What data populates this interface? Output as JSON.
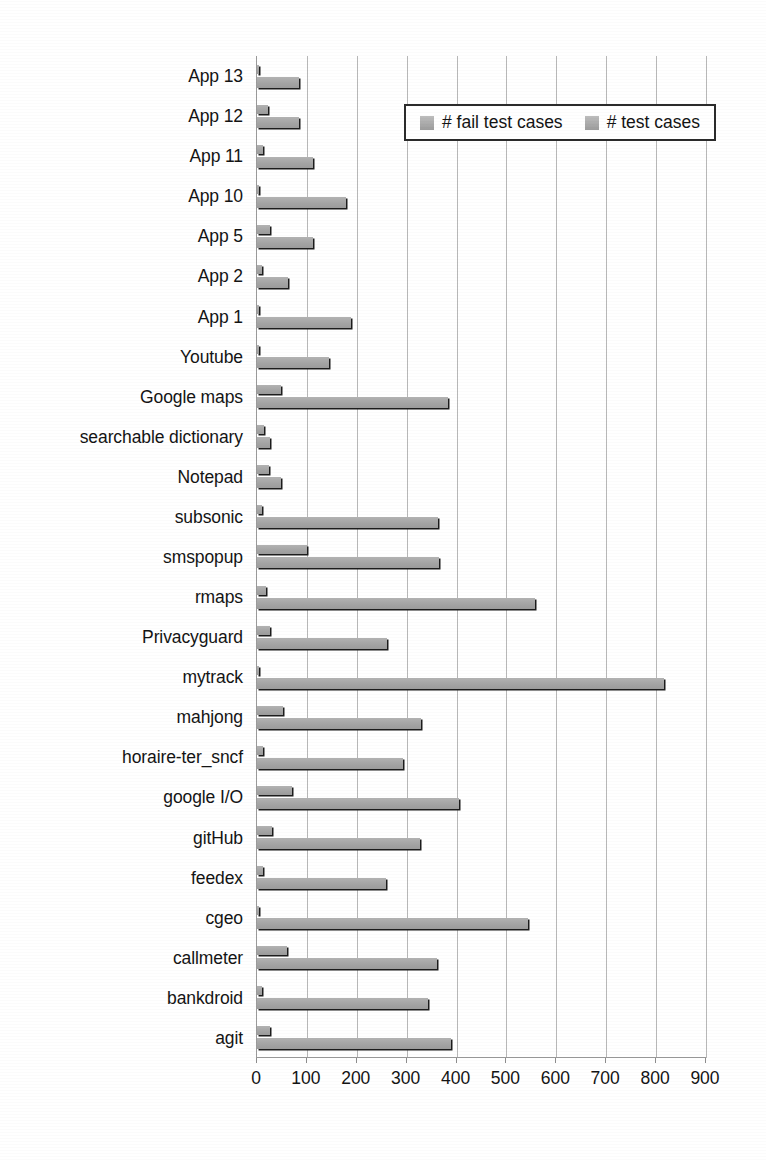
{
  "chart_data": {
    "type": "bar",
    "orientation": "horizontal",
    "title": "",
    "subtitle": "",
    "xlabel": "",
    "ylabel": "",
    "xlim": [
      0,
      900
    ],
    "xticks": [
      0,
      100,
      200,
      300,
      400,
      500,
      600,
      700,
      800,
      900
    ],
    "xtick_labels": [
      "0",
      "100",
      "200",
      "300",
      "400",
      "500",
      "600",
      "700",
      "800",
      "900"
    ],
    "grid": true,
    "grid_axis": "x",
    "legend_position": "top-right",
    "legend": [
      "# fail test cases",
      "# test cases"
    ],
    "colors": {
      "series_fill": "#a6a6a6",
      "series_shadow": "#1c1c1c",
      "gridline": "#b8b8b8",
      "axis": "#9a9a9a",
      "text": "#141414",
      "background": "#ffffff"
    },
    "categories": [
      "App 13",
      "App 12",
      "App 11",
      "App 10",
      "App 5",
      "App 2",
      "App 1",
      "Youtube",
      "Google maps",
      "searchable dictionary",
      "Notepad",
      "subsonic",
      "smspopup",
      "rmaps",
      "Privacyguard",
      "mytrack",
      "mahjong",
      "horaire-ter_sncf",
      "google I/O",
      "gitHub",
      "feedex",
      "cgeo",
      "callmeter",
      "bankdroid",
      "agit"
    ],
    "series": [
      {
        "name": "# fail test cases",
        "values": [
          3,
          22,
          12,
          4,
          26,
          11,
          4,
          4,
          48,
          14,
          24,
          11,
          100,
          19,
          26,
          4,
          52,
          13,
          70,
          31,
          13,
          4,
          60,
          11,
          26
        ]
      },
      {
        "name": "# test cases",
        "values": [
          84,
          85,
          112,
          178,
          112,
          62,
          188,
          145,
          383,
          27,
          48,
          363,
          365,
          558,
          260,
          815,
          329,
          293,
          405,
          327,
          258,
          543,
          360,
          342,
          388
        ]
      }
    ]
  }
}
